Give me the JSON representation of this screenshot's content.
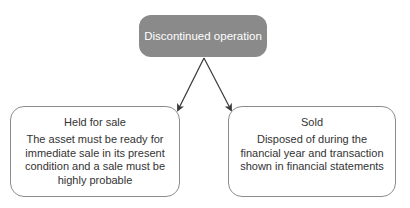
{
  "diagram": {
    "root": {
      "label": "Discontinued operation",
      "fill_color": "#8a8a8a",
      "text_color": "#ffffff"
    },
    "children": [
      {
        "title": "Held for sale",
        "description": "The asset must be ready for immediate sale in its present condition and a sale must be highly probable"
      },
      {
        "title": "Sold",
        "description": "Disposed of during the financial year and transaction shown in financial statements"
      }
    ],
    "edges": [
      {
        "from": "Discontinued operation",
        "to": "Held for sale"
      },
      {
        "from": "Discontinued operation",
        "to": "Sold"
      }
    ],
    "border_color": "#8c8c8c",
    "arrow_color": "#3a3a3a"
  }
}
